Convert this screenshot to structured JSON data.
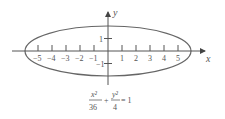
{
  "chart_data": {
    "type": "line",
    "title": "",
    "equation": {
      "term1_num": "x²",
      "term1_den": "36",
      "plus": "+",
      "term2_num": "y²",
      "term2_den": "4",
      "rhs": "= 1"
    },
    "xlabel": "x",
    "ylabel": "y",
    "x_ticks": [
      -5,
      -4,
      -3,
      -2,
      -1,
      1,
      2,
      3,
      4,
      5
    ],
    "x_tick_labels": [
      "-5",
      "-4",
      "-3",
      "-2",
      "-1",
      "1",
      "2",
      "3",
      "4",
      "5"
    ],
    "y_ticks": [
      1,
      -1
    ],
    "y_tick_labels": [
      "1",
      "-1"
    ],
    "xlim": [
      -7.5,
      7
    ],
    "ylim": [
      -2.5,
      3
    ],
    "grid": false,
    "series": [
      {
        "name": "ellipse",
        "semi_major_a": 6,
        "semi_minor_b": 2,
        "center": [
          0,
          0
        ]
      }
    ]
  },
  "colors": {
    "curve": "#666666",
    "axis": "#555555"
  }
}
